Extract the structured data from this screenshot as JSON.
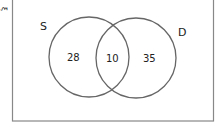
{
  "diagram": {
    "type": "venn",
    "universal_symbol": "ξ",
    "sets": [
      {
        "label": "S",
        "only": "28"
      },
      {
        "label": "D",
        "only": "35"
      }
    ],
    "intersection": "10"
  }
}
